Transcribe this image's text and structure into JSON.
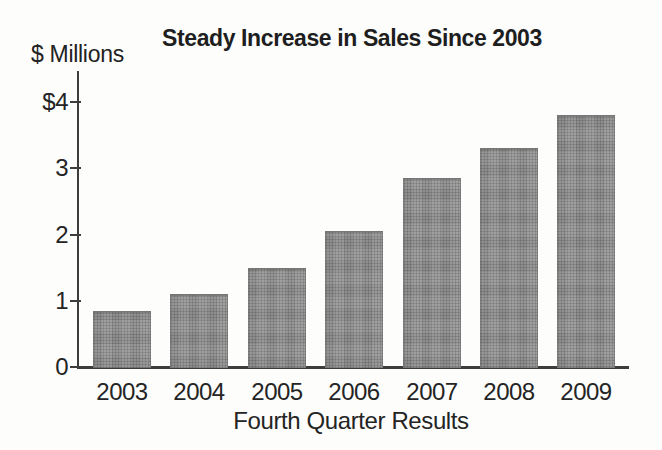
{
  "chart_data": {
    "type": "bar",
    "title": "Steady Increase in Sales Since 2003",
    "y_axis_label": "$ Millions",
    "xlabel": "Fourth Quarter Results",
    "categories": [
      "2003",
      "2004",
      "2005",
      "2006",
      "2007",
      "2008",
      "2009"
    ],
    "values": [
      0.85,
      1.1,
      1.5,
      2.05,
      2.85,
      3.3,
      3.8
    ],
    "y_ticks": [
      {
        "label": "$4",
        "value": 4
      },
      {
        "label": "3",
        "value": 3
      },
      {
        "label": "2",
        "value": 2
      },
      {
        "label": "1",
        "value": 1
      },
      {
        "label": "0",
        "value": 0
      }
    ],
    "ylim": [
      0,
      4.5
    ],
    "grid": false,
    "legend": "none",
    "bar_color": "#8e8e8e",
    "axis_color": "#3d3d3d",
    "text_color": "#242424"
  }
}
